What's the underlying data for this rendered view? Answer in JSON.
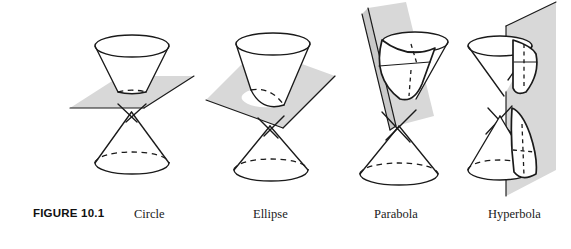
{
  "figure": {
    "number_label": "FIGURE 10.1",
    "panels": [
      {
        "id": "circle",
        "label": "Circle",
        "plane_orientation": "horizontal",
        "cut_nappe": "upper",
        "section_shape": "circle"
      },
      {
        "id": "ellipse",
        "label": "Ellipse",
        "plane_orientation": "tilted",
        "cut_nappe": "upper",
        "section_shape": "ellipse"
      },
      {
        "id": "parabola",
        "label": "Parabola",
        "plane_orientation": "steeply-tilted-parallel-to-generator",
        "cut_nappe": "upper",
        "section_shape": "parabola"
      },
      {
        "id": "hyperbola",
        "label": "Hyperbola",
        "plane_orientation": "vertical",
        "cut_nappe": "both",
        "section_shape": "hyperbola-two-branches"
      }
    ]
  },
  "colors": {
    "plane_fill": "#d8d8d8",
    "plane_fill_dark": "#c9c9c9",
    "ink": "#1a1a1a",
    "background": "#ffffff"
  }
}
